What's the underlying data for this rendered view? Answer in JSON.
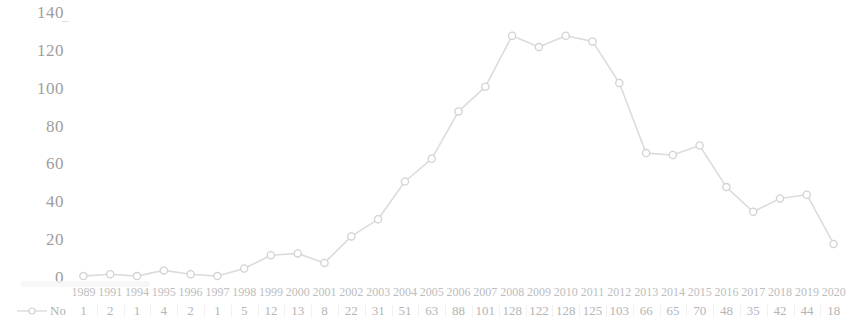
{
  "chart_data": {
    "type": "line",
    "title": "",
    "xlabel": "",
    "ylabel": "",
    "legend": [
      {
        "name": "No",
        "marker": "circle",
        "color": "#d8d8d8"
      }
    ],
    "legend_position": "left-bottom-row-header",
    "grid": false,
    "ylim": [
      0,
      140
    ],
    "yticks": [
      0,
      20,
      40,
      60,
      80,
      100,
      120,
      140
    ],
    "ytick_labels": [
      "0",
      "20",
      "40",
      "60",
      "80",
      "100",
      "120",
      "140"
    ],
    "categories": [
      "1989",
      "1991",
      "1994",
      "1995",
      "1996",
      "1997",
      "1998",
      "1999",
      "2000",
      "2001",
      "2002",
      "2003",
      "2004",
      "2005",
      "2006",
      "2007",
      "2008",
      "2009",
      "2010",
      "2011",
      "2012",
      "2013",
      "2014",
      "2015",
      "2016",
      "2017",
      "2018",
      "2019",
      "2020"
    ],
    "series": [
      {
        "name": "No",
        "values": [
          1,
          2,
          1,
          4,
          2,
          1,
          5,
          12,
          13,
          8,
          22,
          31,
          51,
          63,
          88,
          101,
          128,
          122,
          128,
          125,
          103,
          66,
          65,
          70,
          48,
          35,
          42,
          44,
          18
        ]
      }
    ],
    "table": {
      "row_header": "No",
      "header_row": [
        "1989",
        "1991",
        "1994",
        "1995",
        "1996",
        "1997",
        "1998",
        "1999",
        "2000",
        "2001",
        "2002",
        "2003",
        "2004",
        "2005",
        "2006",
        "2007",
        "2008",
        "2009",
        "2010",
        "2011",
        "2012",
        "2013",
        "2014",
        "2015",
        "2016",
        "2017",
        "2018",
        "2019",
        "2020"
      ],
      "value_row": [
        "1",
        "2",
        "1",
        "4",
        "2",
        "1",
        "5",
        "12",
        "13",
        "8",
        "22",
        "31",
        "51",
        "63",
        "88",
        "101",
        "128",
        "122",
        "128",
        "125",
        "103",
        "66",
        "65",
        "70",
        "48",
        "35",
        "42",
        "44",
        "18"
      ]
    },
    "colors": {
      "line": "#dcdcdc",
      "marker_stroke": "#d2d2d2",
      "marker_fill": "#ffffff",
      "axis_text": "#9e9e9e",
      "table_text": "#bdbdbd",
      "background": "#ffffff"
    }
  }
}
